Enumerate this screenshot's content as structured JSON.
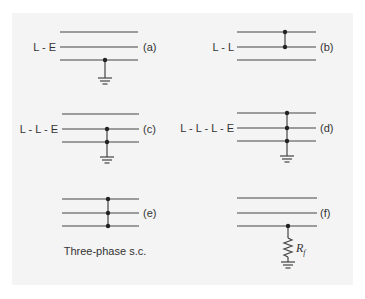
{
  "figure": {
    "line_color": "#444444",
    "paper_color": "#f4f4f4",
    "panels": [
      {
        "id": "a",
        "tag": "(a)",
        "left_label": "L - E",
        "caption": "",
        "description": "Single line-to-earth fault: bottom conductor to ground"
      },
      {
        "id": "b",
        "tag": "(b)",
        "left_label": "L - L",
        "caption": "",
        "description": "Line-to-line fault: top and middle conductors joined"
      },
      {
        "id": "c",
        "tag": "(c)",
        "left_label": "L - L - E",
        "caption": "",
        "description": "Double line-to-earth fault: middle and bottom conductors to ground"
      },
      {
        "id": "d",
        "tag": "(d)",
        "left_label": "L - L - L - E",
        "caption": "",
        "description": "Three lines to earth fault"
      },
      {
        "id": "e",
        "tag": "(e)",
        "left_label": "",
        "caption": "Three-phase s.c.",
        "description": "Three-phase short circuit"
      },
      {
        "id": "f",
        "tag": "(f)",
        "left_label": "",
        "caption": "",
        "resistor_label": "R",
        "resistor_subscript": "f",
        "description": "Line-to-earth fault through fault resistance"
      }
    ]
  }
}
